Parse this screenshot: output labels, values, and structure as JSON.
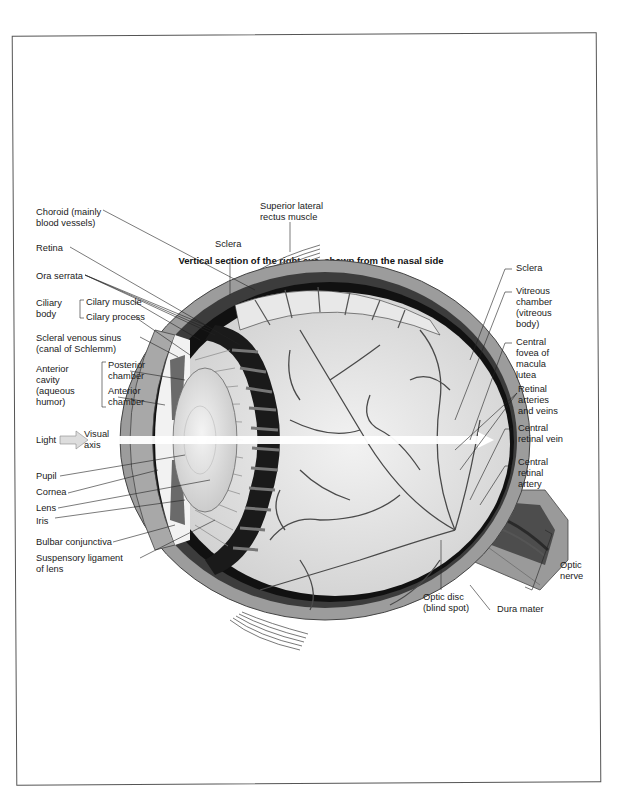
{
  "title": "Vertical section of the right eye, shown from the nasal side",
  "colors": {
    "sclera": "#9a9a9a",
    "choroid": "#3a3a3a",
    "retina_black": "#111111",
    "vitreous": "#e6e6e6",
    "vessel": "#4a4a4a",
    "muscle_lines": "#555555",
    "cornea": "#a8a8a8",
    "lens": "#dcdcdc",
    "visual_axis": "#ffffff"
  },
  "labels_left": {
    "choroid": [
      "Choroid (mainly",
      "blood vessels)"
    ],
    "retina": "Retina",
    "ora_serrata": "Ora serrata",
    "ciliary_body": [
      "Ciliary",
      "body"
    ],
    "ciliary_muscle": "Cilary muscle",
    "ciliary_process": "Cilary process",
    "scleral_venous_sinus": [
      "Scleral venous sinus",
      "(canal of Schlemm)"
    ],
    "anterior_cavity": [
      "Anterior",
      "cavity",
      "(aqueous",
      "humor)"
    ],
    "posterior_chamber": [
      "Posterior",
      "chamber"
    ],
    "anterior_chamber": [
      "Anterior",
      "chamber"
    ],
    "light": "Light",
    "visual_axis": [
      "Visual",
      "axis"
    ],
    "pupil": "Pupil",
    "cornea": "Cornea",
    "lens": "Lens",
    "iris": "Iris",
    "bulbar_conjunctiva": "Bulbar conjunctiva",
    "suspensory_ligament": [
      "Suspensory ligament",
      "of lens"
    ]
  },
  "labels_top": {
    "superior_lateral_rectus": [
      "Superior lateral",
      "rectus muscle"
    ],
    "sclera": "Sclera"
  },
  "labels_right": {
    "sclera": "Sclera",
    "vitreous_chamber": [
      "Vitreous",
      "chamber",
      "(vitreous",
      "body)"
    ],
    "central_fovea": [
      "Central",
      "fovea of",
      "macula",
      "lutea"
    ],
    "retinal_arteries_veins": [
      "Retinal",
      "arteries",
      "and veins"
    ],
    "central_retinal_vein": [
      "Central",
      "retinal vein"
    ],
    "central_retinal_artery": [
      "Central",
      "retinal",
      "artery"
    ],
    "optic_nerve": [
      "Optic",
      "nerve"
    ],
    "dura_mater": "Dura mater",
    "optic_disc": [
      "Optic disc",
      "(blind spot)"
    ]
  }
}
